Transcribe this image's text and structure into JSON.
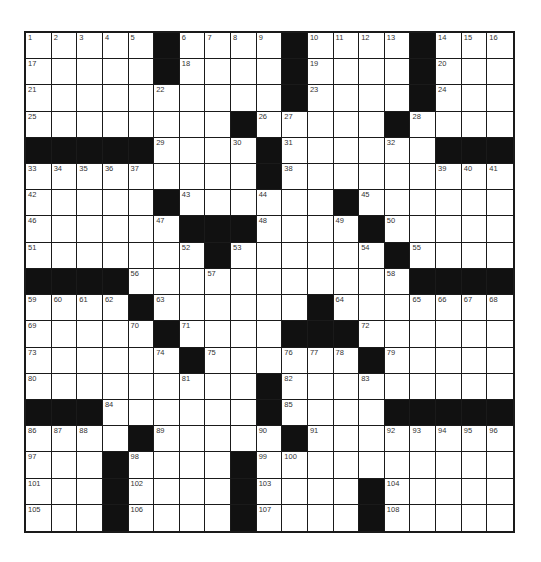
{
  "puzzle": {
    "rows": 19,
    "cols": 19,
    "colors": {
      "block": "#111111",
      "cell": "#ffffff",
      "line": "#1a1a1a"
    },
    "grid": [
      [
        "1",
        "2",
        "3",
        "4",
        "5",
        "#",
        "6",
        "7",
        "8",
        "9",
        "#",
        "10",
        "11",
        "12",
        "13",
        "#",
        "14",
        "15",
        "16"
      ],
      [
        "17",
        ".",
        ".",
        ".",
        ".",
        "#",
        "18",
        ".",
        ".",
        ".",
        "#",
        "19",
        ".",
        ".",
        ".",
        "#",
        "20",
        ".",
        "."
      ],
      [
        "21",
        ".",
        ".",
        ".",
        ".",
        "22",
        ".",
        ".",
        ".",
        ".",
        "#",
        "23",
        ".",
        ".",
        ".",
        "#",
        "24",
        ".",
        "."
      ],
      [
        "25",
        ".",
        ".",
        ".",
        ".",
        ".",
        ".",
        ".",
        "#",
        "26",
        "27",
        ".",
        ".",
        ".",
        "#",
        "28",
        ".",
        ".",
        "."
      ],
      [
        "#",
        "#",
        "#",
        "#",
        "#",
        "29",
        ".",
        ".",
        "30",
        "#",
        "31",
        ".",
        ".",
        ".",
        "32",
        ".",
        "#",
        "#",
        "#"
      ],
      [
        "33",
        "34",
        "35",
        "36",
        "37",
        ".",
        ".",
        ".",
        ".",
        "#",
        "38",
        ".",
        ".",
        ".",
        ".",
        ".",
        "39",
        "40",
        "41"
      ],
      [
        "42",
        ".",
        ".",
        ".",
        ".",
        "#",
        "43",
        ".",
        ".",
        "44",
        ".",
        ".",
        "#",
        "45",
        ".",
        ".",
        ".",
        ".",
        "."
      ],
      [
        "46",
        ".",
        ".",
        ".",
        ".",
        "47",
        "#",
        "#",
        "#",
        "48",
        ".",
        ".",
        "49",
        "#",
        "50",
        ".",
        ".",
        ".",
        "."
      ],
      [
        "51",
        ".",
        ".",
        ".",
        ".",
        ".",
        "52",
        "#",
        "53",
        ".",
        ".",
        ".",
        ".",
        "54",
        "#",
        "55",
        ".",
        ".",
        "."
      ],
      [
        "#",
        "#",
        "#",
        "#",
        "56",
        ".",
        ".",
        "57",
        ".",
        ".",
        ".",
        ".",
        ".",
        ".",
        "58",
        "#",
        "#",
        "#",
        "#"
      ],
      [
        "59",
        "60",
        "61",
        "62",
        "#",
        "63",
        ".",
        ".",
        ".",
        ".",
        ".",
        "#",
        "64",
        ".",
        ".",
        "65",
        "66",
        "67",
        "68"
      ],
      [
        "69",
        ".",
        ".",
        ".",
        "70",
        "#",
        "71",
        ".",
        ".",
        ".",
        "#",
        "#",
        "#",
        "72",
        ".",
        ".",
        ".",
        ".",
        "."
      ],
      [
        "73",
        ".",
        ".",
        ".",
        ".",
        "74",
        "#",
        "75",
        ".",
        ".",
        "76",
        "77",
        "78",
        "#",
        "79",
        ".",
        ".",
        ".",
        "."
      ],
      [
        "80",
        ".",
        ".",
        ".",
        ".",
        ".",
        "81",
        ".",
        ".",
        "#",
        "82",
        ".",
        ".",
        "83",
        ".",
        ".",
        ".",
        ".",
        "."
      ],
      [
        "#",
        "#",
        "#",
        "84",
        ".",
        ".",
        ".",
        ".",
        ".",
        "#",
        "85",
        ".",
        ".",
        ".",
        "#",
        "#",
        "#",
        "#",
        "#"
      ],
      [
        "86",
        "87",
        "88",
        ".",
        "#",
        "89",
        ".",
        ".",
        ".",
        "90",
        "#",
        "91",
        ".",
        ".",
        "92",
        "93",
        "94",
        "95",
        "96"
      ],
      [
        "97",
        ".",
        ".",
        "#",
        "98",
        ".",
        ".",
        ".",
        "#",
        "99",
        "100",
        ".",
        ".",
        ".",
        ".",
        ".",
        ".",
        ".",
        "."
      ],
      [
        "101",
        ".",
        ".",
        "#",
        "102",
        ".",
        ".",
        ".",
        "#",
        "103",
        ".",
        ".",
        ".",
        "#",
        "104",
        ".",
        ".",
        ".",
        "."
      ],
      [
        "105",
        ".",
        ".",
        "#",
        "106",
        ".",
        ".",
        ".",
        "#",
        "107",
        ".",
        ".",
        ".",
        "#",
        "108",
        ".",
        ".",
        ".",
        "."
      ]
    ]
  }
}
